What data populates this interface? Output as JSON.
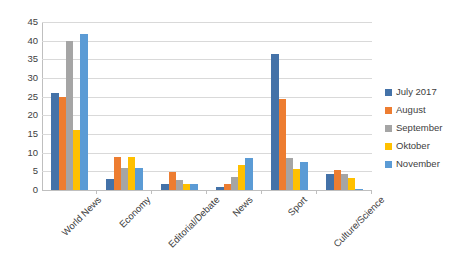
{
  "chart_data": {
    "type": "bar",
    "title": "",
    "subtitle": "",
    "xlabel": "",
    "ylabel": "",
    "ylim": [
      0,
      45
    ],
    "ytick_step": 5,
    "yticks": [
      45,
      40,
      35,
      30,
      25,
      20,
      15,
      10,
      5,
      0
    ],
    "grid": true,
    "grid_axis": "y",
    "legend_position": "right",
    "categories": [
      "World News",
      "Economy",
      "Editorial/Debate",
      "News",
      "Sport",
      "Culture/Science"
    ],
    "series": [
      {
        "name": "July 2017",
        "color": "#4472a8",
        "values": [
          25.9,
          2.9,
          1.7,
          0.7,
          36.4,
          4.4
        ]
      },
      {
        "name": "August",
        "color": "#ed7d31",
        "values": [
          24.9,
          8.9,
          4.8,
          1.6,
          24.5,
          5.3
        ]
      },
      {
        "name": "September",
        "color": "#a5a5a5",
        "values": [
          39.9,
          5.9,
          2.7,
          3.6,
          8.5,
          4.3
        ]
      },
      {
        "name": "Oktober",
        "color": "#ffc000",
        "values": [
          16.0,
          8.8,
          1.7,
          6.6,
          5.6,
          3.3
        ]
      },
      {
        "name": "November",
        "color": "#5b9bd5",
        "values": [
          41.8,
          5.8,
          1.6,
          8.5,
          7.4,
          0.4
        ]
      }
    ]
  },
  "axis": {
    "y_tick_labels": [
      "45",
      "40",
      "35",
      "30",
      "25",
      "20",
      "15",
      "10",
      "5",
      "0"
    ]
  },
  "legend": {
    "items": [
      {
        "label": "July 2017",
        "color": "#4472a8"
      },
      {
        "label": "August",
        "color": "#ed7d31"
      },
      {
        "label": "September",
        "color": "#a5a5a5"
      },
      {
        "label": "Oktober",
        "color": "#ffc000"
      },
      {
        "label": "November",
        "color": "#5b9bd5"
      }
    ]
  }
}
